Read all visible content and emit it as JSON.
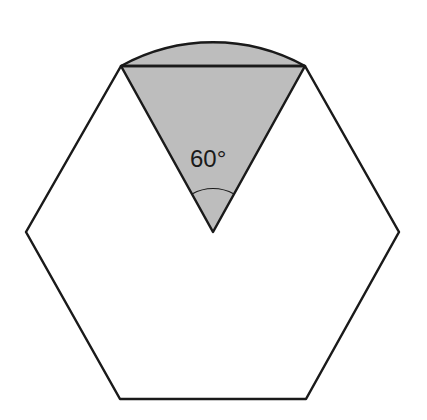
{
  "diagram": {
    "shape": "regular hexagon with shaded sector",
    "angle_label": "60°",
    "colors": {
      "stroke": "#1a1a1a",
      "shade": "#bdbdbd",
      "background": "#ffffff"
    }
  }
}
